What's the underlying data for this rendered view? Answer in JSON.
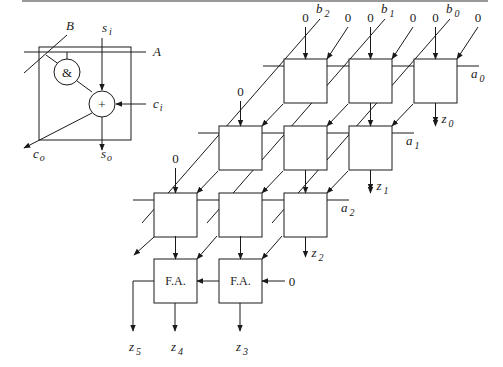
{
  "figure": {
    "legend_cell": {
      "and_symbol": "&",
      "plus_symbol": "+",
      "labels": {
        "B": "B",
        "A": "A",
        "s_in": {
          "base": "s",
          "sub": "i"
        },
        "c_in": {
          "base": "c",
          "sub": "i"
        },
        "c_out": {
          "base": "c",
          "sub": "o"
        },
        "s_out": {
          "base": "s",
          "sub": "o"
        }
      }
    },
    "array": {
      "top_zero": "0",
      "b_inputs": [
        {
          "base": "b",
          "sub": "2"
        },
        {
          "base": "b",
          "sub": "1"
        },
        {
          "base": "b",
          "sub": "0"
        }
      ],
      "a_inputs": [
        {
          "base": "a",
          "sub": "0"
        },
        {
          "base": "a",
          "sub": "1"
        },
        {
          "base": "a",
          "sub": "2"
        }
      ],
      "outputs": [
        {
          "base": "z",
          "sub": "0"
        },
        {
          "base": "z",
          "sub": "1"
        },
        {
          "base": "z",
          "sub": "2"
        },
        {
          "base": "z",
          "sub": "3"
        },
        {
          "base": "z",
          "sub": "4"
        },
        {
          "base": "z",
          "sub": "5"
        }
      ],
      "full_adder_label": "F.A.",
      "carry_in_zero": "0"
    }
  }
}
